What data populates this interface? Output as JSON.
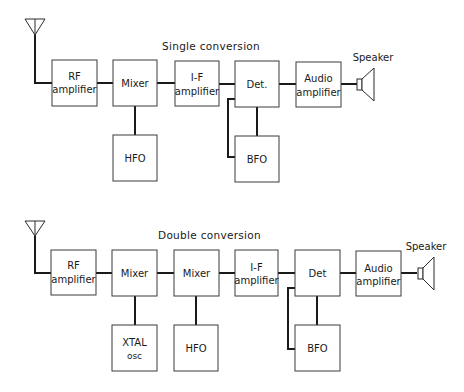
{
  "diagrams": {
    "single": {
      "title": "Single conversion",
      "speaker_label": "Speaker",
      "blocks": {
        "rf": [
          "RF",
          "amplifier"
        ],
        "mixer": "Mixer",
        "hfo": "HFO",
        "if": [
          "I-F",
          "amplifier"
        ],
        "det": "Det.",
        "bfo": "BFO",
        "audio": [
          "Audio",
          "amplifier"
        ]
      }
    },
    "double": {
      "title": "Double conversion",
      "speaker_label": "Speaker",
      "blocks": {
        "rf": [
          "RF",
          "amplifier"
        ],
        "mixer1": "Mixer",
        "xtal": [
          "XTAL",
          "osc"
        ],
        "mixer2": "Mixer",
        "hfo": "HFO",
        "if": [
          "I-F",
          "amplifier"
        ],
        "det": "Det",
        "bfo": "BFO",
        "audio": [
          "Audio",
          "amplifier"
        ]
      }
    }
  },
  "colors": {
    "line": "#1a1a1a",
    "box_border": "#3a3a3a",
    "background": "#ffffff"
  }
}
